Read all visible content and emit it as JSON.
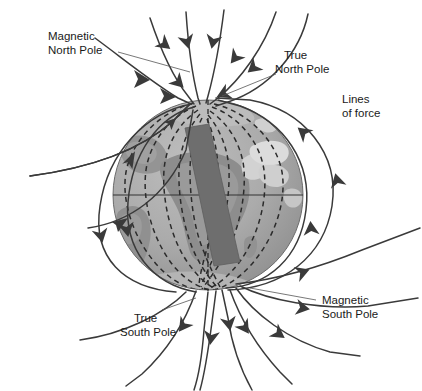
{
  "figure": {
    "type": "diagram"
  },
  "labels": {
    "magnetic_north": "Magnetic\nNorth Pole",
    "magnetic_north_line1": "Magnetic",
    "magnetic_north_line2": "North Pole",
    "true_north_line1": "True",
    "true_north_line2": "North Pole",
    "lines_of_force_line1": "Lines",
    "lines_of_force_line2": "of force",
    "true_south_line1": "True",
    "true_south_line2": "South Pole",
    "magnetic_south_line1": "Magnetic",
    "magnetic_south_line2": "South Pole"
  },
  "colors": {
    "background": "#ffffff",
    "ocean": "#a8a8a8",
    "land": "#8f8f8f",
    "land_highlight": "#d6d6d6",
    "bar_magnet": "#6e6e6e",
    "field_line": "#3a3a3a",
    "inner_dashed": "#2b2b2b",
    "text": "#1a1a1a",
    "equator": "#333333",
    "globe_shadow": "#989898",
    "globe_highlight": "#b8b8b8"
  },
  "geometry": {
    "globe_center_x": 208,
    "globe_center_y": 195,
    "globe_radius": 95,
    "equator_y": 195,
    "bar_tilt_degrees": 11,
    "true_north_x": 208,
    "true_north_y": 100,
    "true_south_x": 208,
    "true_south_y": 290,
    "magnetic_north_x": 190,
    "magnetic_north_y": 103,
    "magnetic_south_x": 228,
    "magnetic_south_y": 288
  },
  "elements": {
    "globe": "earth-globe",
    "bar_magnet": "bar-magnet",
    "equator": "equator-line",
    "rotation_axis": "rotation-axis",
    "field_lines_count": 22
  }
}
